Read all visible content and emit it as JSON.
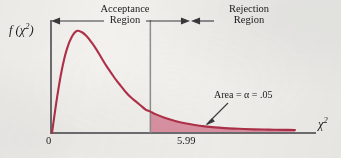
{
  "figure": {
    "axes": {
      "y_title": "f (χ²)",
      "y_title_base": "f (χ",
      "y_title_sup": "2",
      "y_title_tail": ")",
      "x_title_base": "χ",
      "x_title_sup": "2"
    },
    "labels": {
      "acceptance_line1": "Acceptance",
      "acceptance_line2": "Region",
      "rejection_line1": "Rejection",
      "rejection_line2": "Region",
      "origin_tick": "0",
      "critical_tick": "5.99",
      "area_callout": "Area = α = .05"
    },
    "colors": {
      "curve": "#b03048",
      "shaded_area": "#d98c9e",
      "axis": "#6e6e70",
      "critical_line": "#8d8d8f",
      "annotation": "#3a3a3c",
      "text": "#1b1b1b",
      "background": "#f2f1ee"
    }
  },
  "chart_data": {
    "type": "line",
    "title": "",
    "subtitle": "",
    "xlabel": "χ²",
    "ylabel": "f (χ²)",
    "distribution": "chi-square",
    "degrees_of_freedom": 2,
    "grid": false,
    "legend": null,
    "xlim": [
      0,
      14.8
    ],
    "ylim": [
      0,
      1
    ],
    "xticks": [
      0,
      5.99
    ],
    "xticklabels": [
      "0",
      "5.99"
    ],
    "yticks": [],
    "yticklabels": [],
    "critical_value": 5.99,
    "alpha": 0.05,
    "shaded_region": {
      "from": 5.99,
      "to": 14.8,
      "area": 0.05,
      "label": "Area = α = .05",
      "fill": "#d98c9e"
    },
    "regions": [
      {
        "name": "Acceptance Region",
        "from": 0,
        "to": 5.99
      },
      {
        "name": "Rejection Region",
        "from": 5.99,
        "to": 14.8
      }
    ],
    "x": [
      0.0,
      0.3,
      0.6,
      0.9,
      1.2,
      1.5,
      1.8,
      2.1,
      2.4,
      2.7,
      3.0,
      3.3,
      3.6,
      3.9,
      4.2,
      4.5,
      4.8,
      5.1,
      5.4,
      5.7,
      5.99,
      6.3,
      6.9,
      7.5,
      8.1,
      8.7,
      9.3,
      9.9,
      10.5,
      11.1,
      11.7,
      12.3,
      12.9,
      13.5,
      14.1,
      14.8
    ],
    "y": [
      0.0,
      0.34,
      0.62,
      0.82,
      0.94,
      1.0,
      0.99,
      0.95,
      0.89,
      0.82,
      0.74,
      0.66,
      0.59,
      0.52,
      0.46,
      0.4,
      0.35,
      0.31,
      0.27,
      0.23,
      0.21,
      0.185,
      0.148,
      0.118,
      0.095,
      0.078,
      0.065,
      0.055,
      0.048,
      0.043,
      0.039,
      0.036,
      0.034,
      0.032,
      0.031,
      0.03
    ]
  }
}
